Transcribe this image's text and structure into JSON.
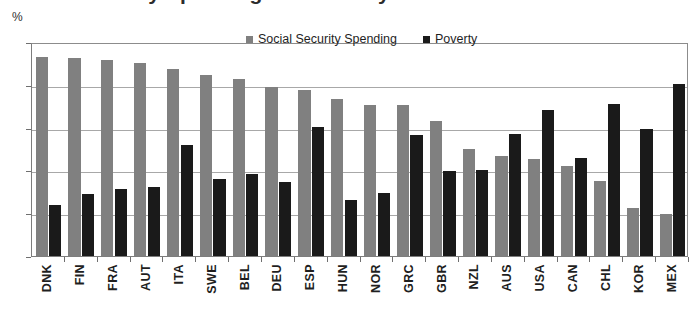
{
  "title": "Social Security Spending and Poverty",
  "y_unit_label": "%",
  "legend": {
    "position": "top-center",
    "items": [
      {
        "label": "Social Security Spending",
        "color": "#808080",
        "icon": "square-swatch"
      },
      {
        "label": "Poverty",
        "color": "#1a1a1a",
        "icon": "square-swatch"
      }
    ]
  },
  "axis": {
    "y_ticks": [
      "0",
      "5",
      "10",
      "15",
      "20",
      "25"
    ]
  },
  "chart_data": {
    "type": "bar",
    "title": "Social Security Spending and Poverty",
    "xlabel": "",
    "ylabel": "%",
    "ylim": [
      0,
      25
    ],
    "ytick_step": 5,
    "grid": true,
    "legend_position": "top-center",
    "categories": [
      "DNK",
      "FIN",
      "FRA",
      "AUT",
      "ITA",
      "SWE",
      "BEL",
      "DEU",
      "ESP",
      "HUN",
      "NOR",
      "GRC",
      "GBR",
      "NZL",
      "AUS",
      "USA",
      "CAN",
      "CHL",
      "KOR",
      "MEX"
    ],
    "series": [
      {
        "name": "Social Security Spending",
        "color": "#808080",
        "values": [
          23.2,
          23.1,
          22.9,
          22.5,
          21.8,
          21.2,
          20.7,
          19.7,
          19.4,
          18.3,
          17.7,
          17.7,
          15.8,
          12.5,
          11.7,
          11.3,
          10.5,
          8.8,
          5.6,
          4.9
        ]
      },
      {
        "name": "Poverty",
        "color": "#1a1a1a",
        "values": [
          6.0,
          7.2,
          7.8,
          8.1,
          13.0,
          9.0,
          9.6,
          8.7,
          15.1,
          6.5,
          7.4,
          14.1,
          9.9,
          10.1,
          14.3,
          17.0,
          11.4,
          17.8,
          14.8,
          20.1
        ]
      }
    ]
  }
}
